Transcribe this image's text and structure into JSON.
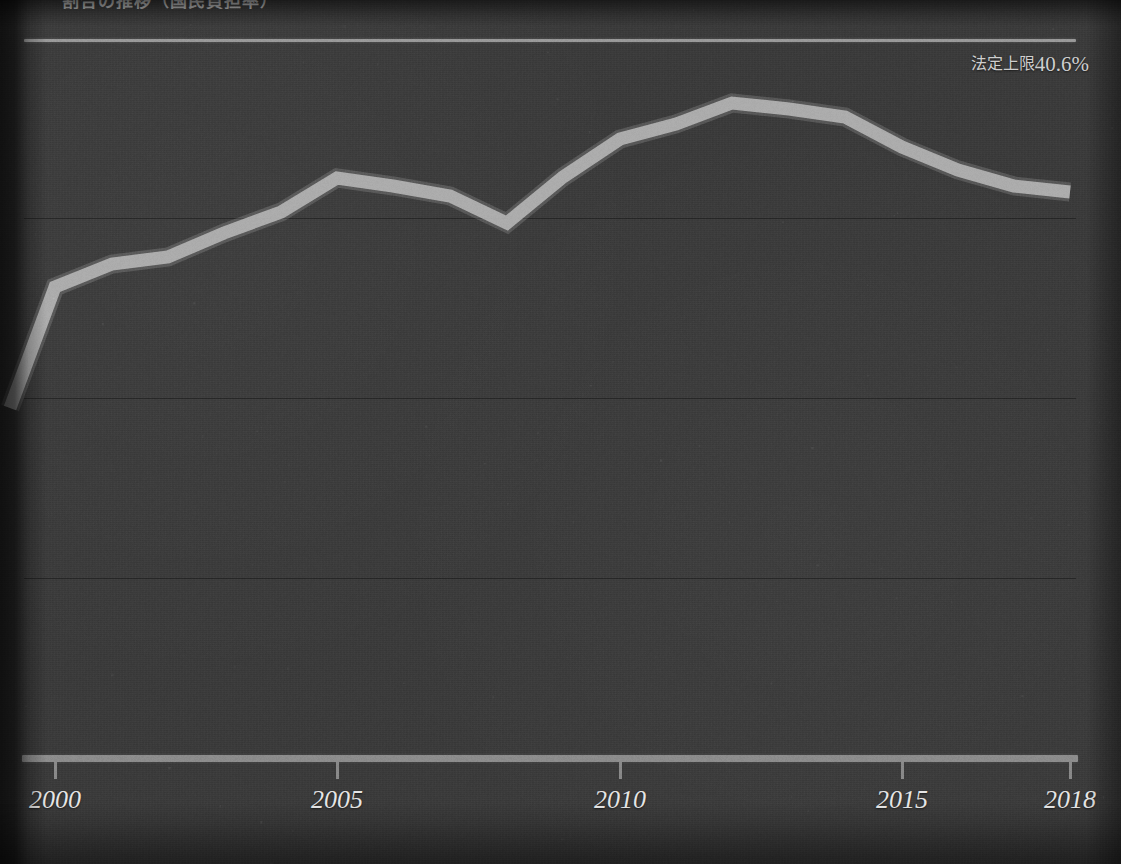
{
  "title_fragment": "割合の推移（国民負担率）",
  "annotation": {
    "label_cjk": "法定上限",
    "label_value": "40.6%",
    "full": "法定上限40.6%"
  },
  "axis": {
    "x_ticks": [
      {
        "label": "2000",
        "x": 55
      },
      {
        "label": "2005",
        "x": 337
      },
      {
        "label": "2010",
        "x": 620
      },
      {
        "label": "2015",
        "x": 902
      },
      {
        "label": "2018",
        "x": 1070
      }
    ],
    "x_min": 1999,
    "x_max": 2018,
    "y_gridlines_px": [
      218,
      398,
      578
    ]
  },
  "colors": {
    "background": "#3a3a3a",
    "series": "#b4b4b4",
    "limit_line": "#9a9a9a",
    "axis": "#8d8d8d",
    "gridline": "#000000",
    "label_text": "#e6e6e6",
    "annotation_text": "#cfcfcf"
  },
  "chart_data": {
    "type": "line",
    "title": "割合の推移（国民負担率）",
    "xlabel": "",
    "ylabel": "",
    "grid": true,
    "legend": "none",
    "annotations": [
      {
        "type": "hline",
        "label": "法定上限40.6%",
        "value": 40.6,
        "position": "top-right"
      }
    ],
    "xlim": [
      1999,
      2018
    ],
    "ylim": [
      0,
      44
    ],
    "x": [
      1999,
      2000,
      2001,
      2002,
      2003,
      2004,
      2005,
      2006,
      2007,
      2008,
      2009,
      2010,
      2011,
      2012,
      2013,
      2014,
      2015,
      2016,
      2017,
      2018
    ],
    "series": [
      {
        "name": "実績値",
        "values": [
          22.6,
          29.1,
          30.3,
          30.6,
          31.8,
          32.8,
          33.5,
          33.1,
          32.6,
          31.9,
          34.1,
          35.6,
          36.3,
          36.8,
          36.6,
          36.6,
          35.5,
          34.5,
          33.8,
          33.5
        ],
        "points_px": [
          {
            "x": 10,
            "y": 408
          },
          {
            "x": 55,
            "y": 287
          },
          {
            "x": 112,
            "y": 264
          },
          {
            "x": 168,
            "y": 257
          },
          {
            "x": 224,
            "y": 233
          },
          {
            "x": 281,
            "y": 212
          },
          {
            "x": 337,
            "y": 178
          },
          {
            "x": 393,
            "y": 186
          },
          {
            "x": 450,
            "y": 196
          },
          {
            "x": 507,
            "y": 223
          },
          {
            "x": 563,
            "y": 177
          },
          {
            "x": 620,
            "y": 139
          },
          {
            "x": 676,
            "y": 124
          },
          {
            "x": 732,
            "y": 103
          },
          {
            "x": 789,
            "y": 109
          },
          {
            "x": 845,
            "y": 117
          },
          {
            "x": 902,
            "y": 147
          },
          {
            "x": 958,
            "y": 170
          },
          {
            "x": 1014,
            "y": 186
          },
          {
            "x": 1070,
            "y": 192
          }
        ]
      }
    ]
  }
}
